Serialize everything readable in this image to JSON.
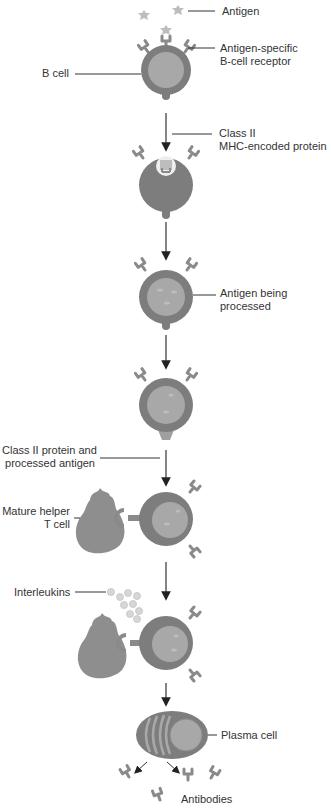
{
  "diagram": {
    "colors": {
      "cell_outer": "#7d7d7d",
      "cell_inner": "#a8a8a8",
      "receptor": "#8a8a8a",
      "antigen": "#bdbdbd",
      "t_cell": "#8e8e8e",
      "interleukin": "#d6d6d6",
      "line": "#333333",
      "text": "#333333"
    },
    "labels": {
      "antigen": "Antigen",
      "receptor": "Antigen-specific\nB-cell receptor",
      "b_cell": "B cell",
      "class2": "Class II\nMHC-encoded protein",
      "processing": "Antigen being\nprocessed",
      "class2_antigen": "Class II protein and\nprocessed antigen",
      "helper_t": "Mature helper\nT cell",
      "interleukins": "Interleukins",
      "plasma": "Plasma cell",
      "antibodies": "Antibodies"
    },
    "steps": [
      "Antigen binds B-cell receptor",
      "Antigen internalized with Class II MHC protein",
      "Antigen being processed",
      "Class II protein presents processed antigen",
      "Mature helper T cell binds",
      "Interleukins released",
      "Plasma cell secretes antibodies"
    ]
  }
}
